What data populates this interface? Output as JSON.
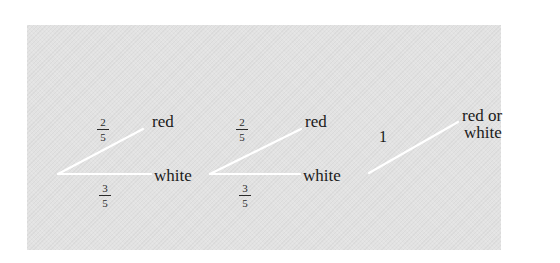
{
  "diagram": {
    "type": "probability-tree",
    "background_color": "#e2e2e2",
    "line_color": "#ffffff",
    "stages": [
      {
        "branches": [
          {
            "outcome": "red",
            "probability": {
              "num": "2",
              "den": "5"
            }
          },
          {
            "outcome": "white",
            "probability": {
              "num": "3",
              "den": "5"
            }
          }
        ]
      },
      {
        "branches": [
          {
            "outcome": "red",
            "probability": {
              "num": "2",
              "den": "5"
            }
          },
          {
            "outcome": "white",
            "probability": {
              "num": "3",
              "den": "5"
            }
          }
        ]
      },
      {
        "branches": [
          {
            "outcome_line1": "red or",
            "outcome_line2": "white",
            "probability": "1"
          }
        ]
      }
    ]
  }
}
